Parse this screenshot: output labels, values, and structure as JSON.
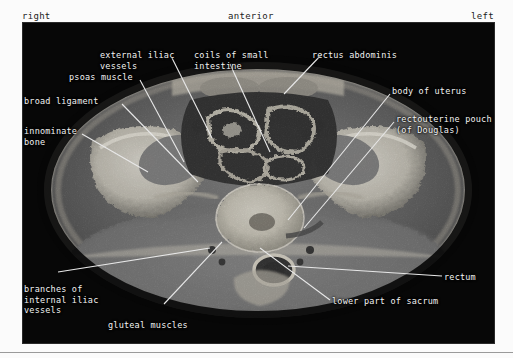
{
  "figure": {
    "modality": "MRI",
    "plane": "axial",
    "region": "female pelvis",
    "background_color": "#060606",
    "label_color": "#f2f2f2",
    "leader_color": "#e8e8e8"
  },
  "orientation": {
    "right": "right",
    "anterior": "anterior",
    "left": "left"
  },
  "labels": [
    {
      "id": "external-iliac-vessels",
      "text": "external iliac\nvessels"
    },
    {
      "id": "coils-of-small-intestine",
      "text": "coils of small\nintestine"
    },
    {
      "id": "rectus-abdominis",
      "text": "rectus abdominis"
    },
    {
      "id": "psoas-muscle",
      "text": "psoas muscle"
    },
    {
      "id": "body-of-uterus",
      "text": "body of uterus"
    },
    {
      "id": "broad-ligament",
      "text": "broad ligament"
    },
    {
      "id": "rectouterine-pouch",
      "text": "rectouterine pouch\n(of Douglas)"
    },
    {
      "id": "innominate-bone",
      "text": "innominate\nbone"
    },
    {
      "id": "branches-internal-iliac",
      "text": "branches of\ninternal iliac\nvessels"
    },
    {
      "id": "gluteal-muscles",
      "text": "gluteal muscles"
    },
    {
      "id": "rectum",
      "text": "rectum"
    },
    {
      "id": "lower-part-of-sacrum",
      "text": "lower part of sacrum"
    }
  ]
}
